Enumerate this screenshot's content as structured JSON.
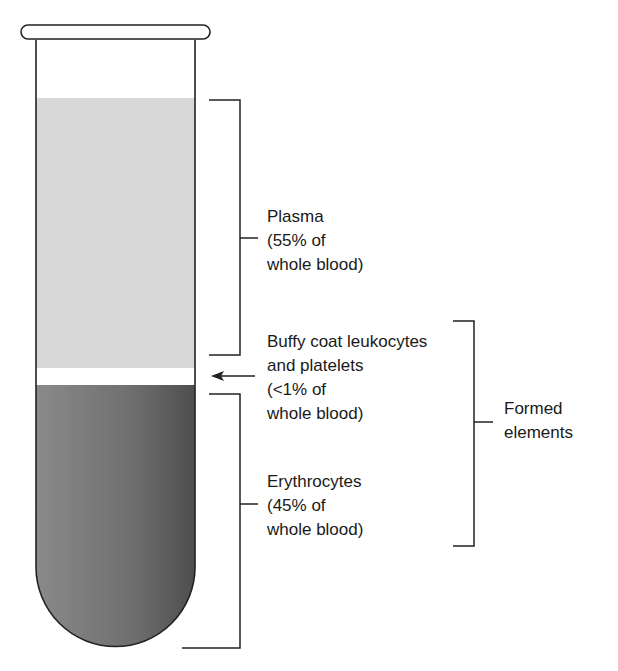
{
  "diagram": {
    "layers": [
      {
        "name": "Plasma",
        "percent": "55% of whole blood",
        "color": "#d6d6d6"
      },
      {
        "name": "Buffy coat leukocytes and platelets",
        "percent": "<1% of whole blood",
        "color": "#ffffff"
      },
      {
        "name": "Erythrocytes",
        "percent": "45% of whole blood",
        "color": "#6e6e6e"
      }
    ],
    "labels": {
      "plasma": {
        "line1": "Plasma",
        "line2": "(55% of",
        "line3": "whole blood)"
      },
      "buffy": {
        "line1": "Buffy coat leukocytes",
        "line2": "and platelets",
        "line3": "(<1% of",
        "line4": "whole blood)"
      },
      "erythrocytes": {
        "line1": "Erythrocytes",
        "line2": "(45% of",
        "line3": "whole blood)"
      },
      "formed": {
        "line1": "Formed",
        "line2": "elements"
      }
    }
  }
}
